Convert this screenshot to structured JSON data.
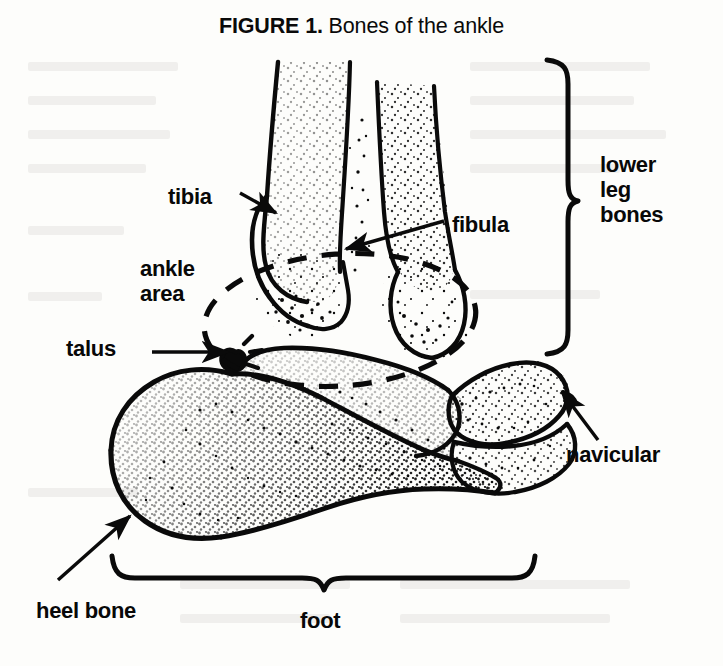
{
  "figure": {
    "label": "FIGURE 1.",
    "caption": " Bones of the ankle",
    "title_full": "FIGURE 1. Bones of the ankle",
    "style": "black ink line drawing with stipple shading on off-white paper",
    "ink_color": "#0a0a0a",
    "paper_color": "#fdfdfb"
  },
  "labels": {
    "tibia": "tibia",
    "fibula": "fibula",
    "ankle_area": "ankle\narea",
    "ankle_area_line1": "ankle",
    "ankle_area_line2": "area",
    "talus": "talus",
    "navicular": "navicular",
    "heel_bone": "heel bone",
    "foot": "foot",
    "lower_leg_bones": "lower\nleg\nbones",
    "lower_leg_bones_line1": "lower",
    "lower_leg_bones_line2": "leg",
    "lower_leg_bones_line3": "bones"
  },
  "annotations": [
    {
      "id": "tibia",
      "text": "tibia",
      "leader": "arrow",
      "points_to": "tibia shaft, lower left"
    },
    {
      "id": "fibula",
      "text": "fibula",
      "leader": "arrow",
      "points_to": "fibula shaft, right"
    },
    {
      "id": "ankle-area",
      "text": "ankle area",
      "leader": "dashed-ellipse",
      "points_to": "ankle joint region"
    },
    {
      "id": "talus",
      "text": "talus",
      "leader": "arrow",
      "points_to": "talus, upper foot"
    },
    {
      "id": "navicular",
      "text": "navicular",
      "leader": "arrow",
      "points_to": "navicular bone, right foot"
    },
    {
      "id": "heel-bone",
      "text": "heel bone",
      "leader": "arrow",
      "points_to": "calcaneus, lower left"
    },
    {
      "id": "foot",
      "text": "foot",
      "leader": "horizontal-brace",
      "points_to": "whole foot"
    },
    {
      "id": "lower-leg-bones",
      "text": "lower leg bones",
      "leader": "vertical-brace",
      "points_to": "tibia and fibula"
    }
  ]
}
